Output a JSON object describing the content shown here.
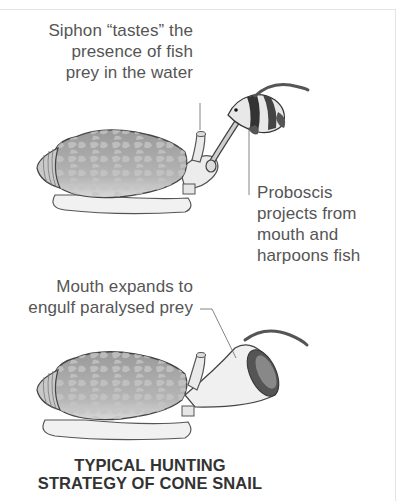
{
  "diagram": {
    "title_lines": [
      "TYPICAL HUNTING",
      "STRATEGY OF CONE SNAIL"
    ],
    "panel1": {
      "siphon_label": [
        "Siphon “tastes” the",
        "presence of fish",
        "prey in the water"
      ],
      "proboscis_label": [
        "Proboscis",
        "projects from",
        "mouth and",
        "harpoons fish"
      ]
    },
    "panel2": {
      "mouth_label": [
        "Mouth expands to",
        "engulf paralysed prey"
      ]
    },
    "colors": {
      "text": "#555555",
      "title": "#333333",
      "shell": "#a8a8a8",
      "body": "#eeeeee",
      "frame": "#e3e3e3"
    }
  }
}
